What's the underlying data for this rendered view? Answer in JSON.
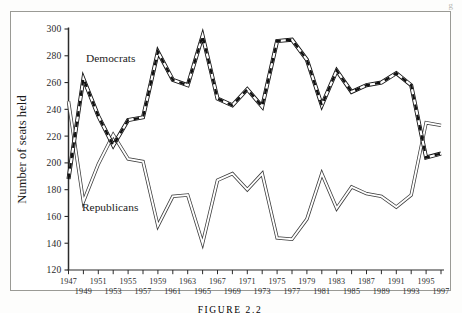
{
  "figure": {
    "caption": "FIGURE 2.2",
    "corner_mark": "g"
  },
  "labels": {
    "democrats": "Democrats",
    "republicans": "Republicans",
    "ylabel": "Number of seats held"
  },
  "colors": {
    "democrat_line": "#111111",
    "republican_line": "#3a3a3a",
    "axis": "#2b2b2b",
    "frame": "#9a9a95",
    "background": "#ffffff"
  },
  "chart_data": {
    "type": "line",
    "title": "",
    "xlabel": "",
    "ylabel": "Number of seats held",
    "ylim": [
      120,
      300
    ],
    "xlim": [
      1947,
      1997
    ],
    "yticks": [
      120,
      140,
      160,
      180,
      200,
      220,
      240,
      260,
      280,
      300
    ],
    "ytick_labels": [
      "120",
      "140",
      "160",
      "180",
      "200",
      "220",
      "240",
      "260",
      "280",
      "300"
    ],
    "xticks": [
      1947,
      1949,
      1951,
      1953,
      1955,
      1957,
      1959,
      1961,
      1963,
      1965,
      1967,
      1969,
      1971,
      1973,
      1975,
      1977,
      1979,
      1981,
      1983,
      1985,
      1987,
      1989,
      1991,
      1993,
      1995,
      1997
    ],
    "xtick_labels_top": [
      "1947",
      "1951",
      "1955",
      "1959",
      "1963",
      "1967",
      "1971",
      "1975",
      "1979",
      "1983",
      "1987",
      "1991",
      "1995"
    ],
    "xtick_labels_bottom": [
      "1949",
      "1953",
      "1957",
      "1961",
      "1965",
      "1969",
      "1973",
      "1977",
      "1981",
      "1985",
      "1989",
      "1993",
      "1997"
    ],
    "grid": false,
    "legend_position": "inline-annotation",
    "x": [
      1947,
      1949,
      1951,
      1953,
      1955,
      1957,
      1959,
      1961,
      1963,
      1965,
      1967,
      1969,
      1971,
      1973,
      1975,
      1977,
      1979,
      1981,
      1983,
      1985,
      1987,
      1989,
      1991,
      1993,
      1995,
      1997
    ],
    "series": [
      {
        "name": "Democrats",
        "values": [
          188,
          263,
          235,
          213,
          232,
          234,
          283,
          262,
          258,
          295,
          248,
          243,
          255,
          242,
          291,
          292,
          277,
          243,
          269,
          253,
          258,
          260,
          267,
          258,
          204,
          207
        ]
      },
      {
        "name": "Republicans",
        "values": [
          246,
          171,
          199,
          221,
          203,
          201,
          153,
          175,
          176,
          140,
          187,
          192,
          180,
          192,
          144,
          143,
          158,
          192,
          166,
          182,
          177,
          175,
          167,
          176,
          230,
          228
        ]
      }
    ]
  }
}
